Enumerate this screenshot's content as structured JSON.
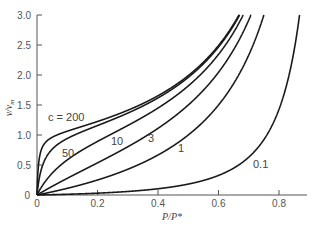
{
  "chart_data": {
    "type": "line",
    "title": "",
    "xlabel": "P/P*",
    "ylabel": "v/v_m",
    "xlim": [
      0,
      0.9
    ],
    "ylim": [
      0,
      3.0
    ],
    "grid": false,
    "legend": "inline curve labels",
    "x_ticks": [
      "0",
      "0.2",
      "0.4",
      "0.6",
      "0.8"
    ],
    "y_ticks": [
      "0",
      "0.5",
      "1.0",
      "1.5",
      "2.0",
      "2.5",
      "3.0"
    ],
    "series": [
      {
        "name": "c = 200",
        "label": "c = 200",
        "c": 200,
        "x": [
          0,
          0.05,
          0.1,
          0.2,
          0.3,
          0.4,
          0.5,
          0.6,
          0.65
        ],
        "values": [
          0,
          1.1,
          1.2,
          1.28,
          1.45,
          1.69,
          2.02,
          2.49,
          2.84
        ]
      },
      {
        "name": "50",
        "label": "50",
        "c": 50,
        "x": [
          0,
          0.05,
          0.1,
          0.2,
          0.3,
          0.4,
          0.5,
          0.6,
          0.65
        ],
        "values": [
          0,
          0.74,
          0.94,
          1.18,
          1.39,
          1.64,
          1.96,
          2.44,
          2.78
        ]
      },
      {
        "name": "10",
        "label": "10",
        "c": 10,
        "x": [
          0,
          0.05,
          0.1,
          0.2,
          0.3,
          0.4,
          0.5,
          0.6,
          0.66
        ],
        "values": [
          0,
          0.37,
          0.58,
          0.89,
          1.14,
          1.42,
          1.82,
          2.31,
          2.77
        ]
      },
      {
        "name": "3",
        "label": "3",
        "c": 3,
        "x": [
          0,
          0.05,
          0.1,
          0.2,
          0.3,
          0.4,
          0.5,
          0.6,
          0.68
        ],
        "values": [
          0,
          0.15,
          0.28,
          0.54,
          0.8,
          1.07,
          1.5,
          2.05,
          2.83
        ]
      },
      {
        "name": "1",
        "label": "1",
        "c": 1,
        "x": [
          0,
          0.1,
          0.2,
          0.3,
          0.4,
          0.5,
          0.6,
          0.7,
          0.75
        ],
        "values": [
          0,
          0.11,
          0.25,
          0.43,
          0.67,
          1.0,
          1.5,
          2.33,
          3.0
        ]
      },
      {
        "name": "0.1",
        "label": "0.1",
        "c": 0.1,
        "x": [
          0,
          0.1,
          0.2,
          0.3,
          0.4,
          0.5,
          0.6,
          0.7,
          0.8,
          0.85
        ],
        "values": [
          0,
          0.011,
          0.027,
          0.055,
          0.11,
          0.18,
          0.34,
          0.72,
          1.82,
          3.0
        ]
      }
    ],
    "annotations": [
      {
        "text": "c = 200",
        "x": 0.13,
        "y": 1.35
      },
      {
        "text": "50",
        "x": 0.1,
        "y": 0.78
      },
      {
        "text": "10",
        "x": 0.25,
        "y": 0.88
      },
      {
        "text": "3",
        "x": 0.33,
        "y": 0.82
      },
      {
        "text": "1",
        "x": 0.47,
        "y": 0.65
      },
      {
        "text": "0.1",
        "x": 0.75,
        "y": 0.5
      }
    ]
  },
  "axes": {
    "x_title": "P/P*",
    "y_title_main": "v/v",
    "y_title_sub": "m",
    "x_origin_label": "0",
    "y_origin_label": "0"
  }
}
